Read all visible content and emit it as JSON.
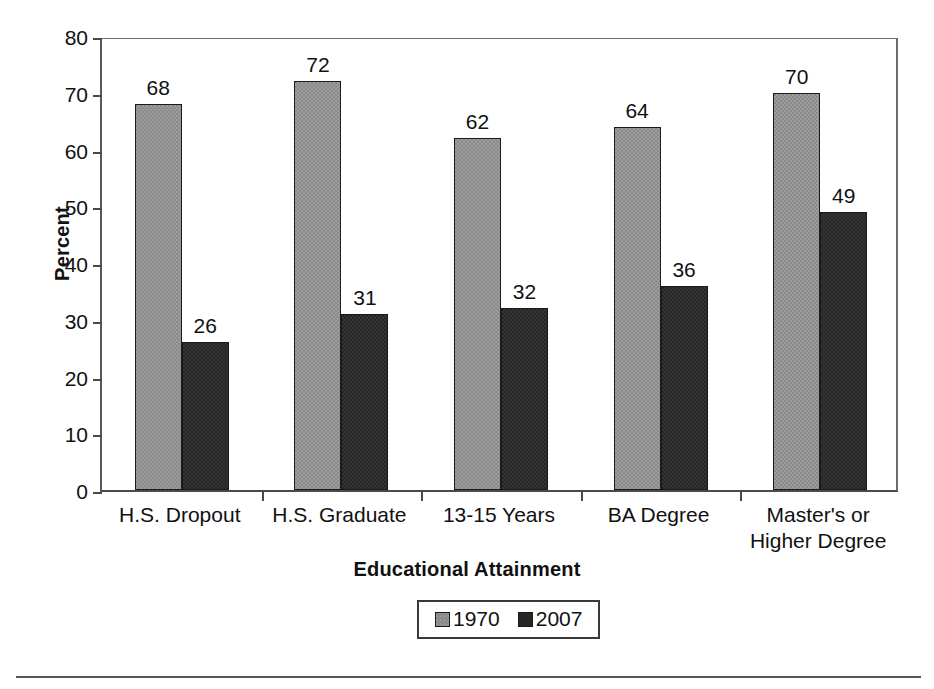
{
  "chart_data": {
    "type": "bar",
    "title": "",
    "subtitle": "",
    "xlabel": "Educational Attainment",
    "ylabel": "Percent",
    "categories": [
      "H.S. Dropout",
      "H.S. Graduate",
      "13-15 Years",
      "BA Degree",
      "Master's or\nHigher Degree"
    ],
    "category_lines": [
      [
        "H.S. Dropout"
      ],
      [
        "H.S. Graduate"
      ],
      [
        "13-15 Years"
      ],
      [
        "BA Degree"
      ],
      [
        "Master's or",
        "Higher Degree"
      ]
    ],
    "series": [
      {
        "name": "1970",
        "color": "#8a8a8a",
        "values": [
          68,
          72,
          62,
          64,
          70
        ]
      },
      {
        "name": "2007",
        "color": "#262626",
        "values": [
          26,
          31,
          32,
          36,
          49
        ]
      }
    ],
    "ylim": [
      0,
      80
    ],
    "ytick_step": 10,
    "yticks": [
      80,
      70,
      60,
      50,
      40,
      30,
      20,
      10,
      0
    ],
    "grid": false,
    "legend_position": "bottom-center",
    "data_labels": true,
    "data_labels_flat": [
      "68",
      "26",
      "72",
      "31",
      "62",
      "32",
      "64",
      "36",
      "70",
      "49"
    ]
  },
  "legend": {
    "items": [
      {
        "label": "1970",
        "swatch": "gray-swatch-icon"
      },
      {
        "label": "2007",
        "swatch": "dark-swatch-icon"
      }
    ]
  },
  "axes": {
    "y_title": "Percent",
    "x_title": "Educational Attainment",
    "y_tick_labels": [
      "80",
      "70",
      "60",
      "50",
      "40",
      "30",
      "20",
      "10",
      "0"
    ]
  },
  "colors": {
    "series_1970": "#8a8a8a",
    "series_2007": "#262626",
    "axis": "#4a4a4a",
    "text": "#111111",
    "background": "#ffffff",
    "rule": "#555555"
  }
}
